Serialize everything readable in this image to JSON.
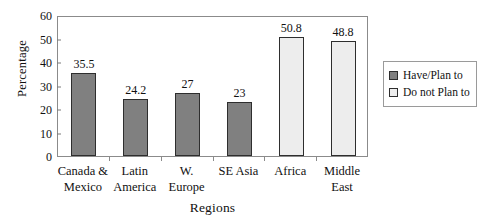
{
  "chart_data": {
    "type": "bar",
    "title": "",
    "xlabel": "Regions",
    "ylabel": "Percentage",
    "ylim": [
      0,
      60
    ],
    "ytick_values": [
      0,
      10,
      20,
      30,
      40,
      50,
      60
    ],
    "ytick_labels": [
      "0",
      "10",
      "20",
      "30",
      "40",
      "50",
      "60"
    ],
    "grid": false,
    "legend_position": "right",
    "categories": [
      "Canada & Mexico",
      "Latin America",
      "W. Europe",
      "SE Asia",
      "Africa",
      "Middle East"
    ],
    "category_label_lines": [
      [
        "Canada &",
        "Mexico"
      ],
      [
        "Latin",
        "America"
      ],
      [
        "W.",
        "Europe"
      ],
      [
        "SE Asia"
      ],
      [
        "Africa"
      ],
      [
        "Middle",
        "East"
      ]
    ],
    "values": [
      35.5,
      24.2,
      27,
      23,
      50.8,
      48.8
    ],
    "value_labels": [
      "35.5",
      "24.2",
      "27",
      "23",
      "50.8",
      "48.8"
    ],
    "bar_series": [
      "Have/Plan to",
      "Have/Plan to",
      "Have/Plan to",
      "Have/Plan to",
      "Do not Plan to",
      "Do not Plan to"
    ],
    "legend": [
      {
        "label": "Have/Plan to",
        "color": "#808080"
      },
      {
        "label": "Do not Plan to",
        "color": "#ededed"
      }
    ],
    "colors": {
      "have_plan_to": "#808080",
      "do_not_plan_to": "#ededed",
      "bar_border": "#2e2e2e",
      "axis": "#8b8b8b",
      "text": "#111111",
      "background": "#ffffff"
    }
  }
}
